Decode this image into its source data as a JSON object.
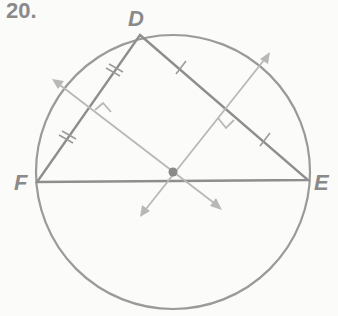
{
  "problem": {
    "number": "20."
  },
  "points": {
    "D": {
      "label": "D",
      "x": 140,
      "y": 35
    },
    "E": {
      "label": "E",
      "x": 308,
      "y": 180
    },
    "F": {
      "label": "F",
      "x": 37,
      "y": 182
    }
  },
  "circumcenter": {
    "x": 173,
    "y": 172
  },
  "circle": {
    "cx": 173,
    "cy": 172,
    "r": 137
  },
  "colors": {
    "stroke": "#9a9a9a",
    "light": "#b8b8b8",
    "text": "#8a8a8a"
  }
}
